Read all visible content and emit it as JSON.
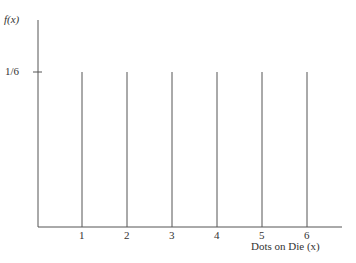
{
  "chart_data": {
    "type": "bar",
    "title": "",
    "xlabel": "Dots on Die (x)",
    "ylabel": "f(x)",
    "categories": [
      "1",
      "2",
      "3",
      "4",
      "5",
      "6"
    ],
    "x": [
      1,
      2,
      3,
      4,
      5,
      6
    ],
    "values": [
      0.1667,
      0.1667,
      0.1667,
      0.1667,
      0.1667,
      0.1667
    ],
    "y_tick_labels": [
      "1/6"
    ],
    "ylim": [
      0,
      0.24
    ],
    "grid": false,
    "legend": null,
    "style": "vertical lines (probability mass function)"
  },
  "labels": {
    "ylabel": "f(x)",
    "xlabel": "Dots on Die (x)",
    "ytick": "1/6",
    "xticks": [
      "1",
      "2",
      "3",
      "4",
      "5",
      "6"
    ]
  },
  "colors": {
    "line": "#555555",
    "text": "#333333"
  }
}
